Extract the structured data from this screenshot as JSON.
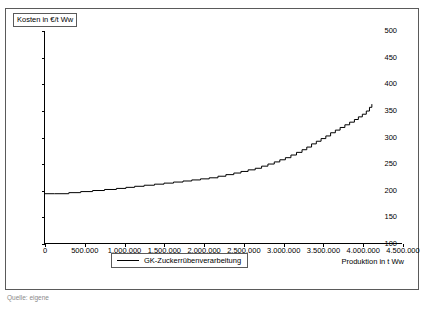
{
  "figure": {
    "y_axis_title": "Kosten in €/t Ww",
    "x_axis_title": "Produktion in t Ww",
    "caption": "Quelle: eigene"
  },
  "legend": {
    "entries": [
      {
        "label": "GK-Zuckerrübenverarbeitung",
        "color": "#000000"
      }
    ]
  },
  "chart_data": {
    "type": "line",
    "title": "",
    "xlabel": "Produktion in t Ww",
    "ylabel": "Kosten in €/t Ww",
    "xlim": [
      0,
      4500000
    ],
    "ylim": [
      100,
      500
    ],
    "grid": false,
    "legend_position": "bottom-center",
    "xticks": [
      0,
      500000,
      1000000,
      1500000,
      2000000,
      2500000,
      3000000,
      3500000,
      4000000,
      4500000
    ],
    "xtick_labels": [
      "0",
      "500.000",
      "1.000.000",
      "1.500.000",
      "2.000.000",
      "2.500.000",
      "3.000.000",
      "3.500.000",
      "4.000.000",
      "4.500.000"
    ],
    "yticks": [
      100,
      150,
      200,
      250,
      300,
      350,
      400,
      450,
      500
    ],
    "ytick_labels": [
      "100",
      "150",
      "200",
      "250",
      "300",
      "350",
      "400",
      "450",
      "500"
    ],
    "series": [
      {
        "name": "GK-Zuckerrübenverarbeitung",
        "color": "#000000",
        "step": "post",
        "x": [
          0,
          120000,
          300000,
          450000,
          600000,
          750000,
          900000,
          1020000,
          1130000,
          1250000,
          1380000,
          1500000,
          1620000,
          1740000,
          1850000,
          1960000,
          2070000,
          2180000,
          2280000,
          2380000,
          2470000,
          2560000,
          2650000,
          2730000,
          2810000,
          2890000,
          2960000,
          3030000,
          3100000,
          3170000,
          3240000,
          3300000,
          3360000,
          3420000,
          3480000,
          3540000,
          3600000,
          3660000,
          3720000,
          3780000,
          3840000,
          3900000,
          3950000,
          4000000,
          4050000,
          4090000,
          4120000
        ],
        "y": [
          193,
          193,
          195,
          197,
          199,
          201,
          203,
          205,
          207,
          209,
          211,
          213,
          215,
          217,
          219,
          221,
          223,
          226,
          229,
          232,
          235,
          238,
          241,
          245,
          249,
          253,
          257,
          261,
          266,
          271,
          276,
          281,
          287,
          292,
          297,
          302,
          308,
          313,
          318,
          323,
          328,
          333,
          338,
          343,
          349,
          356,
          362
        ]
      }
    ]
  }
}
